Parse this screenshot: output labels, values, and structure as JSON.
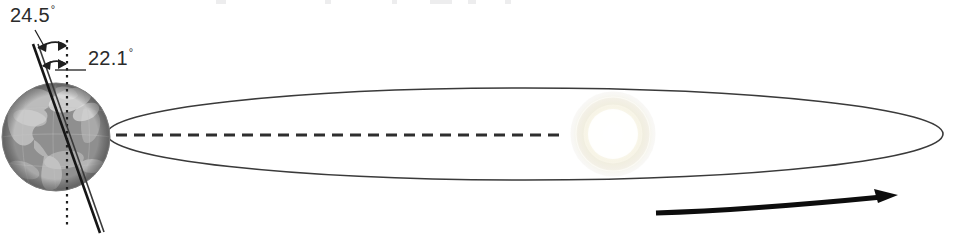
{
  "diagram": {
    "type": "astronomy-schematic",
    "canvas": {
      "width": 968,
      "height": 236,
      "background": "#ffffff"
    },
    "labels": {
      "obliquity_max": {
        "value": "24.5",
        "degree_symbol": "°",
        "text": "24.5°"
      },
      "obliquity_min": {
        "value": "22.1",
        "degree_symbol": "°",
        "text": "22.1°"
      }
    },
    "objects": {
      "earth": {
        "name": "Earth",
        "center_x": 56,
        "center_y": 137,
        "radius": 54,
        "appearance": "grayscale satellite globe showing the Americas with cloud cover"
      },
      "sun": {
        "name": "Sun",
        "center_x": 613,
        "center_y": 134,
        "radius": 40,
        "appearance": "very faint washed-out pale glow"
      },
      "orbit": {
        "name": "Orbital ellipse",
        "center_x": 525,
        "center_y": 134,
        "radius_x": 418,
        "radius_y": 46,
        "stroke": "#3a3a3a"
      },
      "orbit_axis": {
        "name": "Orbital plane reference line",
        "style": "dashed",
        "y": 135,
        "x_start": 62,
        "x_end": 566
      },
      "rotation_axis": {
        "name": "Earth rotation axis (tilted)",
        "x_top": 34,
        "y_top": 45,
        "x_bottom": 101,
        "y_bottom": 233,
        "stroke": "#1d1d1d"
      },
      "vertical_reference": {
        "name": "Vertical reference line (orbital plane normal)",
        "style": "dotted",
        "x": 67,
        "y_start": 40,
        "y_end": 227
      },
      "direction_arrow": {
        "name": "Orbital direction of travel arrow",
        "points": "right",
        "x_start": 655,
        "y_start": 212,
        "x_end": 897,
        "y_end": 196
      }
    },
    "colors": {
      "line": "#3a3a3a",
      "axis": "#1d1d1d",
      "text": "#2b2b2b",
      "arrow": "#0d0d0d",
      "background": "#ffffff"
    }
  }
}
